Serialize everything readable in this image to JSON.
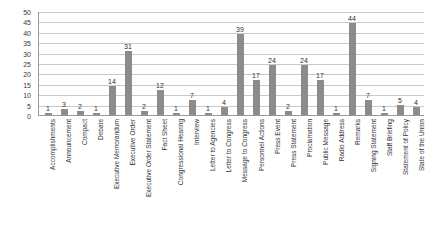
{
  "chart_data": {
    "type": "bar",
    "title": "",
    "xlabel": "",
    "ylabel": "",
    "ylim": [
      0,
      50
    ],
    "grid": true,
    "legend": "none",
    "bar_color": "#8c8c8c",
    "y_ticks": [
      50,
      45,
      40,
      35,
      30,
      25,
      20,
      15,
      10,
      5,
      0
    ],
    "categories": [
      "Accomplishments",
      "Announcement",
      "Compact",
      "Debate",
      "Executive Memorandum",
      "Executive Order",
      "Executive Order Statement",
      "Fact Sheet",
      "Congressional Hearing",
      "Interview",
      "Letter to Agencies",
      "Letter to Congress",
      "Message to Congress",
      "Personnel Actions",
      "Press Event",
      "Press Statement",
      "Proclamation",
      "Public Message",
      "Radio Address",
      "Remarks",
      "Signing Statement",
      "Staff Briefing",
      "Statement of Policy",
      "State of the Union"
    ],
    "values": [
      1,
      3,
      2,
      1,
      14,
      31,
      2,
      12,
      1,
      7,
      1,
      4,
      39,
      17,
      24,
      2,
      24,
      17,
      1,
      44,
      7,
      1,
      5,
      4
    ]
  }
}
